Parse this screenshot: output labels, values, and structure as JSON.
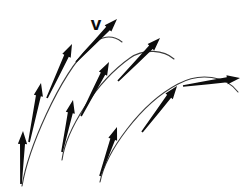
{
  "figure": {
    "background_color": "#ffffff",
    "arrow_color": "#0d0d0d",
    "trajectory_color": "#3a3a3a",
    "width": 252,
    "height": 191
  },
  "labels": [
    {
      "id": "velocity-label",
      "text": "v",
      "x": 96,
      "y": 30,
      "font_size": 19,
      "bold": true
    }
  ],
  "chart_data": {
    "type": "diagram",
    "xlabel": "",
    "ylabel": "",
    "trajectories": [
      {
        "id": "trajectory-1",
        "launch": [
          22,
          186
        ],
        "apex": [
          110,
          36
        ],
        "end": [
          122,
          42
        ],
        "path": "M 22 186 C 28 150 58 78 90 46 C 100 36 112 34 122 42",
        "arrows": [
          {
            "id": "t1-arrow-1",
            "x1": 21,
            "y1": 184,
            "x2": 23,
            "y2": 131,
            "angle_deg": 88,
            "length": 53
          },
          {
            "id": "t1-arrow-2",
            "x1": 29,
            "y1": 142,
            "x2": 41,
            "y2": 83,
            "angle_deg": 78,
            "length": 60
          },
          {
            "id": "t1-arrow-3",
            "x1": 47,
            "y1": 98,
            "x2": 72,
            "y2": 44,
            "angle_deg": 65,
            "length": 59
          },
          {
            "id": "t1-arrow-4",
            "x1": 76,
            "y1": 62,
            "x2": 117,
            "y2": 19,
            "angle_deg": 46,
            "length": 59
          }
        ]
      },
      {
        "id": "trajectory-2",
        "launch": [
          62,
          160
        ],
        "apex": [
          152,
          56
        ],
        "end": [
          174,
          59
        ],
        "path": "M 62 160 C 66 130 96 82 130 58 C 144 48 164 50 174 59",
        "arrows": [
          {
            "id": "t2-arrow-1",
            "x1": 62,
            "y1": 152,
            "x2": 73,
            "y2": 100,
            "angle_deg": 78,
            "length": 53
          },
          {
            "id": "t2-arrow-2",
            "x1": 81,
            "y1": 116,
            "x2": 109,
            "y2": 62,
            "angle_deg": 63,
            "length": 61
          },
          {
            "id": "t2-arrow-3",
            "x1": 118,
            "y1": 81,
            "x2": 160,
            "y2": 38,
            "angle_deg": 46,
            "length": 60
          }
        ]
      },
      {
        "id": "trajectory-3",
        "launch": [
          100,
          182
        ],
        "apex": [
          206,
          82
        ],
        "end": [
          238,
          92
        ],
        "path": "M 100 182 C 106 152 140 104 178 84 C 200 72 226 76 238 92",
        "arrows": [
          {
            "id": "t3-arrow-1",
            "x1": 100,
            "y1": 176,
            "x2": 117,
            "y2": 127,
            "angle_deg": 71,
            "length": 52
          },
          {
            "id": "t3-arrow-2",
            "x1": 142,
            "y1": 132,
            "x2": 177,
            "y2": 86,
            "angle_deg": 53,
            "length": 58
          },
          {
            "id": "t3-arrow-3",
            "x1": 183,
            "y1": 86,
            "x2": 240,
            "y2": 78,
            "angle_deg": 8,
            "length": 58
          }
        ]
      }
    ]
  }
}
